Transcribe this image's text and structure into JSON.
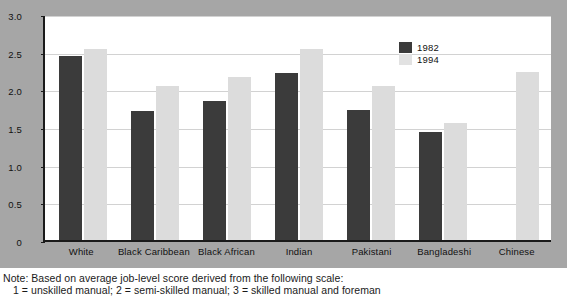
{
  "chart_data": {
    "type": "bar",
    "title": "",
    "xlabel": "",
    "ylabel": "",
    "ylim": [
      0,
      3.0
    ],
    "ytick_values": [
      "3.0",
      "2.5",
      "2.0",
      "1.5",
      "1.0",
      "0.5",
      "0"
    ],
    "grid": true,
    "legend_position": "top-right",
    "categories": [
      "White",
      "Black Caribbean",
      "Black African",
      "Indian",
      "Pakistani",
      "Bangladeshi",
      "Chinese"
    ],
    "series": [
      {
        "name": "1982",
        "color": "#3b3b3b",
        "values": [
          2.44,
          1.71,
          1.84,
          2.22,
          1.72,
          1.43,
          null
        ]
      },
      {
        "name": "1994",
        "color": "#dcdcdc",
        "values": [
          2.54,
          2.04,
          2.17,
          2.54,
          2.04,
          1.55,
          2.23
        ]
      }
    ]
  },
  "legend": {
    "items": [
      {
        "label": "1982",
        "swatch": "dark"
      },
      {
        "label": "1994",
        "swatch": "light"
      }
    ]
  },
  "note": {
    "line1": "Note: Based on average job-level score derived from the following scale:",
    "line2": "1 = unskilled manual; 2 = semi-skilled manual; 3 = skilled manual and foreman"
  }
}
